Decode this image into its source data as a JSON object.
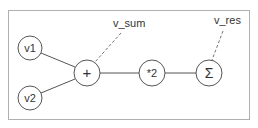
{
  "diagram": {
    "frame": {
      "x": 8,
      "y": 10,
      "width": 241,
      "height": 109,
      "stroke": "#b0b0b0"
    },
    "colors": {
      "stroke": "#555555",
      "dashed": "#777777",
      "text": "#333333",
      "background": "#ffffff"
    },
    "nodes": [
      {
        "id": "v1",
        "label": "v1",
        "cx": 30,
        "cy": 48,
        "r": 12
      },
      {
        "id": "v2",
        "label": "v2",
        "cx": 30,
        "cy": 98,
        "r": 12
      },
      {
        "id": "plus",
        "label": "+",
        "cx": 87,
        "cy": 73,
        "r": 13
      },
      {
        "id": "times2",
        "label": "*2",
        "cx": 152,
        "cy": 73,
        "r": 13
      },
      {
        "id": "sigma",
        "label": "Σ",
        "cx": 209,
        "cy": 73,
        "r": 13
      }
    ],
    "edges": [
      {
        "from": "v1",
        "to": "plus"
      },
      {
        "from": "v2",
        "to": "plus"
      },
      {
        "from": "plus",
        "to": "times2"
      },
      {
        "from": "times2",
        "to": "sigma"
      }
    ],
    "annotations": [
      {
        "label": "v_sum",
        "x": 113,
        "y": 27,
        "line": {
          "x1": 121,
          "y1": 33,
          "x2": 95,
          "y2": 63
        }
      },
      {
        "label": "v_res",
        "x": 214,
        "y": 24,
        "line": {
          "x1": 223,
          "y1": 31,
          "x2": 212,
          "y2": 60
        }
      }
    ]
  }
}
